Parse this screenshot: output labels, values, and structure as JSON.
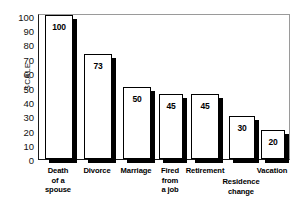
{
  "chart_data": {
    "type": "bar",
    "title": "",
    "xlabel": "",
    "ylabel": "SCALE",
    "ylim": [
      0,
      100
    ],
    "ytick_step": 10,
    "yticks": [
      100,
      90,
      80,
      70,
      60,
      50,
      40,
      30,
      20,
      10,
      0
    ],
    "grid": false,
    "legend": null,
    "categories": [
      "Death of a spouse",
      "Divorce",
      "Marriage",
      "Fired from a job",
      "Retirement",
      "Residence change",
      "Vacation"
    ],
    "category_lines": [
      [
        "Death",
        "of a",
        "spouse"
      ],
      [
        "Divorce"
      ],
      [
        "Marriage"
      ],
      [
        "Fired",
        "from",
        "a job"
      ],
      [
        "Retirement"
      ],
      [
        "Residence",
        "change"
      ],
      [
        "Vacation"
      ]
    ],
    "values": [
      100,
      73,
      50,
      45,
      45,
      30,
      20
    ],
    "value_labels": [
      "100",
      "73",
      "50",
      "45",
      "45",
      "30",
      "20"
    ],
    "style": {
      "bar_fill": "#ffffff",
      "bar_outline": "#000000",
      "bar_shadow": "#000000",
      "frame_color": "#9a9a9a",
      "axis_color": "#1a1a1a",
      "text_color": "#000000",
      "background": "#ffffff"
    }
  },
  "axis": {
    "y_title": "SCALE",
    "tick_100": "100",
    "tick_90": "90",
    "tick_80": "80",
    "tick_70": "70",
    "tick_60": "60",
    "tick_50": "50",
    "tick_40": "40",
    "tick_30": "30",
    "tick_20": "20",
    "tick_10": "10",
    "tick_0": "0"
  }
}
